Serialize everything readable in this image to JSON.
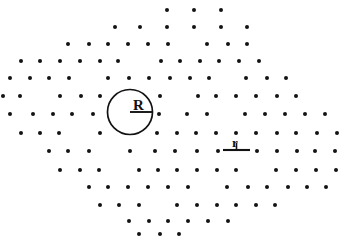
{
  "figure": {
    "background_color": "#ffffff",
    "dot_color": "#131313",
    "line_color": "#121212",
    "width": 352,
    "height": 237
  },
  "annotations": {
    "radius_label": "R",
    "spacing_label": "r"
  },
  "chart_data": {
    "type": "scatter",
    "title": "",
    "xlabel": "",
    "ylabel": "",
    "xlim": [
      0,
      352
    ],
    "ylim": [
      237,
      0
    ],
    "grid": false,
    "legend": null,
    "lattice": {
      "row_spacing_px": 19.2,
      "column_spacing_px": 26.5,
      "row_offset_px": 13.2,
      "rows": 13
    },
    "series": [
      {
        "name": "lattice points",
        "marker": "dot",
        "marker_size_px": 2.6,
        "points": [
          [
            167,
            10
          ],
          [
            194,
            10
          ],
          [
            221,
            10
          ],
          [
            115,
            27
          ],
          [
            140,
            27
          ],
          [
            167,
            27
          ],
          [
            194,
            27
          ],
          [
            221,
            27
          ],
          [
            247,
            27
          ],
          [
            68,
            44
          ],
          [
            89,
            44
          ],
          [
            108,
            44
          ],
          [
            128,
            44
          ],
          [
            148,
            44
          ],
          [
            168,
            44
          ],
          [
            207,
            44
          ],
          [
            228,
            44
          ],
          [
            247,
            44
          ],
          [
            21,
            61
          ],
          [
            40,
            61
          ],
          [
            60,
            61
          ],
          [
            80,
            61
          ],
          [
            100,
            61
          ],
          [
            118,
            61
          ],
          [
            161,
            61
          ],
          [
            180,
            61
          ],
          [
            200,
            61
          ],
          [
            219,
            61
          ],
          [
            239,
            61
          ],
          [
            259,
            61
          ],
          [
            10,
            78
          ],
          [
            30,
            78
          ],
          [
            49,
            78
          ],
          [
            69,
            78
          ],
          [
            108,
            78
          ],
          [
            129,
            78
          ],
          [
            149,
            78
          ],
          [
            170,
            78
          ],
          [
            190,
            78
          ],
          [
            209,
            78
          ],
          [
            246,
            78
          ],
          [
            267,
            78
          ],
          [
            286,
            78
          ],
          [
            3,
            96
          ],
          [
            20,
            96
          ],
          [
            60,
            96
          ],
          [
            81,
            96
          ],
          [
            100,
            96
          ],
          [
            160,
            96
          ],
          [
            198,
            96
          ],
          [
            216,
            96
          ],
          [
            236,
            96
          ],
          [
            256,
            96
          ],
          [
            277,
            96
          ],
          [
            296,
            96
          ],
          [
            10,
            114
          ],
          [
            33,
            114
          ],
          [
            53,
            114
          ],
          [
            72,
            114
          ],
          [
            93,
            114
          ],
          [
            159,
            114
          ],
          [
            187,
            114
          ],
          [
            207,
            114
          ],
          [
            245,
            114
          ],
          [
            265,
            114
          ],
          [
            285,
            114
          ],
          [
            305,
            114
          ],
          [
            325,
            114
          ],
          [
            21,
            133
          ],
          [
            40,
            133
          ],
          [
            59,
            133
          ],
          [
            100,
            133
          ],
          [
            157,
            133
          ],
          [
            177,
            133
          ],
          [
            196,
            133
          ],
          [
            216,
            133
          ],
          [
            236,
            133
          ],
          [
            256,
            133
          ],
          [
            277,
            133
          ],
          [
            296,
            133
          ],
          [
            317,
            133
          ],
          [
            337,
            133
          ],
          [
            49,
            151
          ],
          [
            68,
            151
          ],
          [
            89,
            151
          ],
          [
            130,
            151
          ],
          [
            155,
            151
          ],
          [
            175,
            151
          ],
          [
            197,
            151
          ],
          [
            218,
            151
          ],
          [
            257,
            151
          ],
          [
            277,
            151
          ],
          [
            297,
            151
          ],
          [
            315,
            151
          ],
          [
            335,
            151
          ],
          [
            60,
            170
          ],
          [
            80,
            170
          ],
          [
            99,
            170
          ],
          [
            139,
            170
          ],
          [
            158,
            170
          ],
          [
            177,
            170
          ],
          [
            197,
            170
          ],
          [
            217,
            170
          ],
          [
            236,
            170
          ],
          [
            276,
            170
          ],
          [
            296,
            170
          ],
          [
            316,
            170
          ],
          [
            336,
            170
          ],
          [
            89,
            187
          ],
          [
            108,
            187
          ],
          [
            128,
            187
          ],
          [
            148,
            187
          ],
          [
            168,
            187
          ],
          [
            188,
            187
          ],
          [
            227,
            187
          ],
          [
            248,
            187
          ],
          [
            267,
            187
          ],
          [
            288,
            187
          ],
          [
            307,
            187
          ],
          [
            326,
            187
          ],
          [
            100,
            205
          ],
          [
            119,
            205
          ],
          [
            139,
            205
          ],
          [
            177,
            205
          ],
          [
            197,
            205
          ],
          [
            217,
            205
          ],
          [
            236,
            205
          ],
          [
            256,
            205
          ],
          [
            275,
            205
          ],
          [
            129,
            221
          ],
          [
            149,
            221
          ],
          [
            168,
            221
          ],
          [
            188,
            221
          ],
          [
            208,
            221
          ],
          [
            228,
            221
          ],
          [
            139,
            234
          ],
          [
            160,
            234
          ],
          [
            179,
            234
          ]
        ]
      }
    ],
    "overlays": [
      {
        "kind": "circle",
        "label": "R",
        "center_px": [
          130,
          112
        ],
        "radius_px": 22.5
      },
      {
        "kind": "radius_line",
        "label": "R",
        "from_px": [
          130,
          112
        ],
        "to_px": [
          152,
          112
        ]
      },
      {
        "kind": "scale_bar",
        "label": "r",
        "from_px": [
          223,
          150
        ],
        "to_px": [
          250,
          150
        ],
        "length_px": 27
      }
    ]
  }
}
